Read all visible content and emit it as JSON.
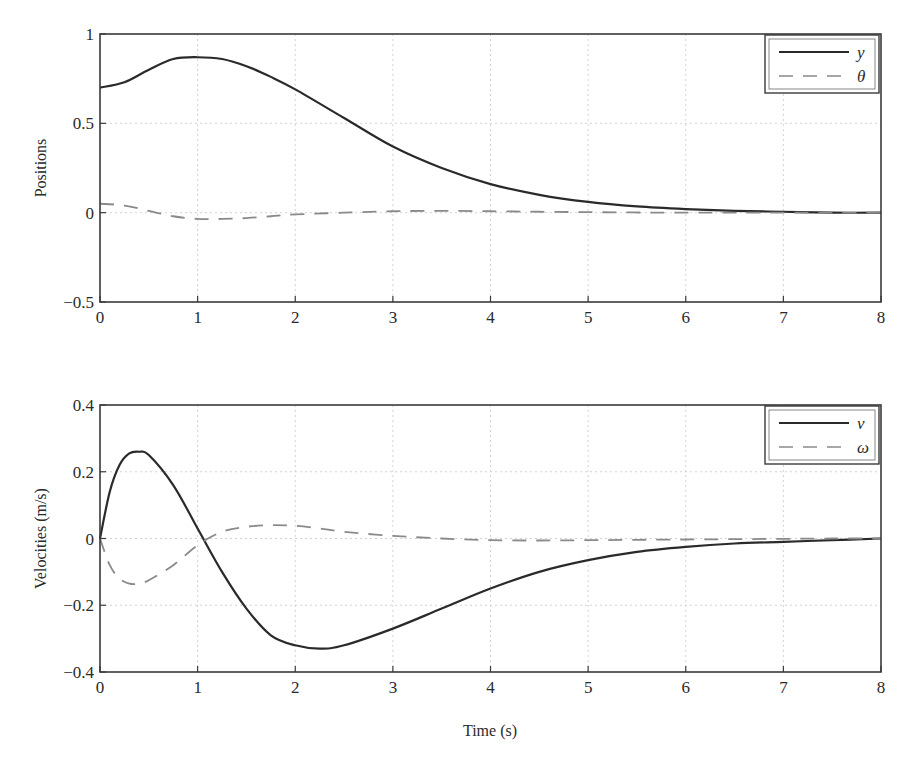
{
  "chart_data": [
    {
      "type": "line",
      "title": "",
      "xlabel": "",
      "ylabel": "Positions",
      "xlim": [
        0,
        8
      ],
      "ylim": [
        -0.5,
        1
      ],
      "xticks": [
        "0",
        "1",
        "2",
        "3",
        "4",
        "5",
        "6",
        "7",
        "8"
      ],
      "yticks": [
        "1",
        "0.5",
        "0",
        "-0.5"
      ],
      "grid": true,
      "legend_position": "upper right",
      "x": [
        0,
        0.25,
        0.5,
        0.75,
        1.0,
        1.25,
        1.5,
        1.75,
        2.0,
        2.5,
        3.0,
        3.5,
        4.0,
        4.5,
        5.0,
        5.5,
        6.0,
        6.5,
        7.0,
        7.5,
        8.0
      ],
      "series": [
        {
          "name": "y",
          "style": "solid",
          "color": "#2a2a2a",
          "values": [
            0.7,
            0.73,
            0.8,
            0.86,
            0.87,
            0.86,
            0.82,
            0.76,
            0.69,
            0.53,
            0.37,
            0.25,
            0.16,
            0.1,
            0.06,
            0.035,
            0.02,
            0.01,
            0.005,
            0.0,
            0.0
          ]
        },
        {
          "name": "θ",
          "style": "dashed",
          "color": "#8a8a8a",
          "values": [
            0.05,
            0.04,
            0.01,
            -0.02,
            -0.035,
            -0.035,
            -0.03,
            -0.02,
            -0.01,
            0.0,
            0.008,
            0.01,
            0.008,
            0.005,
            0.003,
            0.001,
            0.0,
            0.0,
            0.0,
            0.0,
            0.0
          ]
        }
      ]
    },
    {
      "type": "line",
      "title": "",
      "xlabel": "Time (s)",
      "ylabel": "Velocities (m/s)",
      "xlim": [
        0,
        8
      ],
      "ylim": [
        -0.4,
        0.4
      ],
      "xticks": [
        "0",
        "1",
        "2",
        "3",
        "4",
        "5",
        "6",
        "7",
        "8"
      ],
      "yticks": [
        "0.4",
        "0.2",
        "0",
        "-0.2",
        "-0.4"
      ],
      "grid": true,
      "legend_position": "upper right",
      "x": [
        0,
        0.1,
        0.2,
        0.3,
        0.4,
        0.5,
        0.75,
        1.0,
        1.25,
        1.5,
        1.75,
        2.0,
        2.25,
        2.5,
        3.0,
        3.5,
        4.0,
        4.5,
        5.0,
        5.5,
        6.0,
        6.5,
        7.0,
        7.5,
        8.0
      ],
      "series": [
        {
          "name": "v",
          "style": "solid",
          "color": "#2a2a2a",
          "values": [
            0.0,
            0.14,
            0.22,
            0.255,
            0.26,
            0.25,
            0.16,
            0.03,
            -0.1,
            -0.21,
            -0.29,
            -0.32,
            -0.33,
            -0.32,
            -0.27,
            -0.21,
            -0.15,
            -0.1,
            -0.065,
            -0.04,
            -0.025,
            -0.015,
            -0.01,
            -0.005,
            0.0
          ]
        },
        {
          "name": "ω",
          "style": "dashed",
          "color": "#8a8a8a",
          "values": [
            0.0,
            -0.08,
            -0.12,
            -0.135,
            -0.135,
            -0.125,
            -0.08,
            -0.02,
            0.02,
            0.035,
            0.04,
            0.038,
            0.03,
            0.02,
            0.008,
            0.0,
            -0.005,
            -0.006,
            -0.005,
            -0.004,
            -0.003,
            -0.002,
            -0.001,
            0.0,
            0.0
          ]
        }
      ]
    }
  ],
  "labels": {
    "top_ylabel": "Positions",
    "bottom_ylabel": "Velocities (m/s)",
    "xlabel": "Time (s)",
    "legend_top": [
      "y",
      "θ"
    ],
    "legend_bottom": [
      "v",
      "ω"
    ]
  }
}
